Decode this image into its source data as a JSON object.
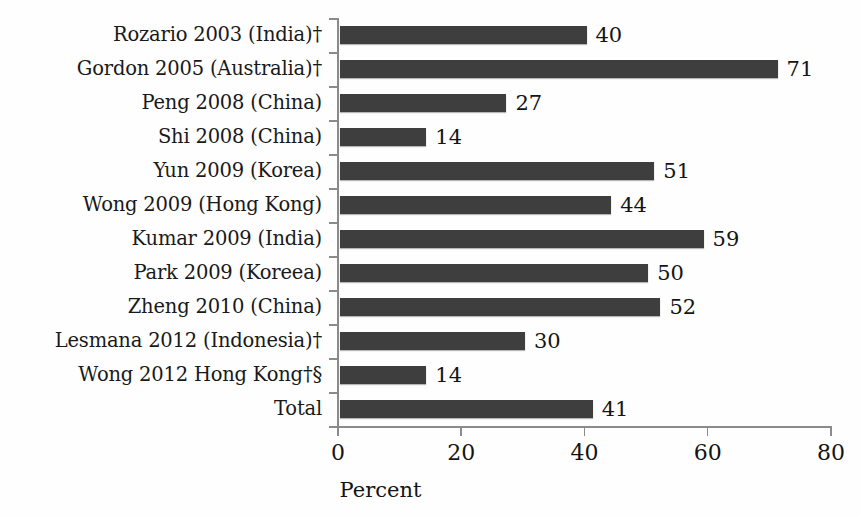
{
  "chart_data": {
    "type": "bar",
    "orientation": "horizontal",
    "title": "",
    "xlabel": "Percent",
    "ylabel": "",
    "xlim": [
      0,
      80
    ],
    "xticks": [
      0,
      20,
      40,
      60,
      80
    ],
    "grid": false,
    "legend": null,
    "bar_color": "#3e3e3e",
    "axis_color": "#8b8b8b",
    "text_color": "#141414",
    "background_color": "#fefefe",
    "categories": [
      "Rozario 2003 (India)†",
      "Gordon 2005 (Australia)†",
      "Peng 2008 (China)",
      "Shi 2008 (China)",
      "Yun 2009 (Korea)",
      "Wong 2009 (Hong Kong)",
      "Kumar 2009 (India)",
      "Park 2009 (Koreea)",
      "Zheng 2010 (China)",
      "Lesmana 2012 (Indonesia)†",
      "Wong 2012 Hong Kong†§",
      "Total"
    ],
    "values": [
      40,
      71,
      27,
      14,
      51,
      44,
      59,
      50,
      52,
      30,
      14,
      41
    ],
    "value_labels": [
      "40",
      "71",
      "27",
      "14",
      "51",
      "44",
      "59",
      "50",
      "52",
      "30",
      "14",
      "41"
    ]
  }
}
